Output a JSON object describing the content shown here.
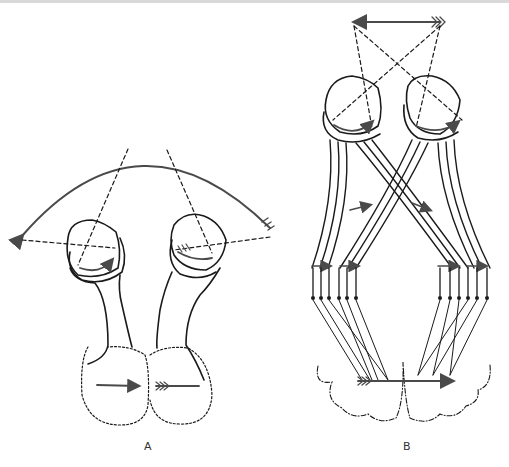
{
  "figure": {
    "panels": [
      {
        "id": "A",
        "label": "A",
        "description": "Two eyes with optic nerves leading to brain hemispheres; a visual field arc with arrows; image projected onto retinas"
      },
      {
        "id": "B",
        "label": "B",
        "description": "Two eyes with crossing optic fibers (optic chiasm) projecting to cortex; a single arrow object at top"
      }
    ],
    "colors": {
      "ink": "#1a1a1a",
      "arrow": "#4a4a4a",
      "dashed": "#222222",
      "frame": "#d9d9d9"
    }
  }
}
